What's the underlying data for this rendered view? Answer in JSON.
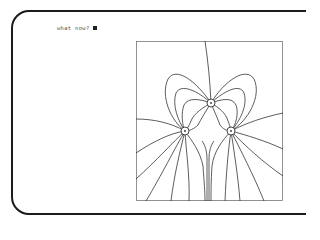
{
  "terminal": {
    "prompt_text": "what now?",
    "cursor": "block-cursor"
  },
  "figure": {
    "nodes": [
      {
        "name": "top-node",
        "x": 75,
        "y": 62
      },
      {
        "name": "left-node",
        "x": 49,
        "y": 90
      },
      {
        "name": "right-node",
        "x": 95,
        "y": 90
      }
    ],
    "line_color": "#333333",
    "frame_color": "#666666"
  }
}
